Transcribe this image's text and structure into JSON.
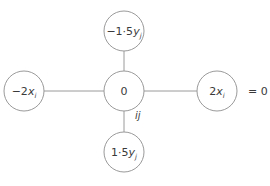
{
  "diagram": {
    "type": "stencil",
    "nodes": {
      "top": {
        "coef": "−1·5",
        "var": "y",
        "sub": "j",
        "cx": 124,
        "cy": 31
      },
      "left": {
        "coef": "−2",
        "var": "x",
        "sub": "i",
        "cx": 24,
        "cy": 91
      },
      "center": {
        "coef": "0",
        "var": "",
        "sub": "",
        "cx": 124,
        "cy": 91
      },
      "right": {
        "coef": "2",
        "var": "x",
        "sub": "i",
        "cx": 217,
        "cy": 91
      },
      "bottom": {
        "coef": "1·5",
        "var": "y",
        "sub": "j",
        "cx": 124,
        "cy": 152
      }
    },
    "center_label": "ij",
    "equation_suffix": "= 0",
    "radius": 20,
    "stroke_color": "#9a9a9a",
    "text_color": "#3a3a3a"
  }
}
